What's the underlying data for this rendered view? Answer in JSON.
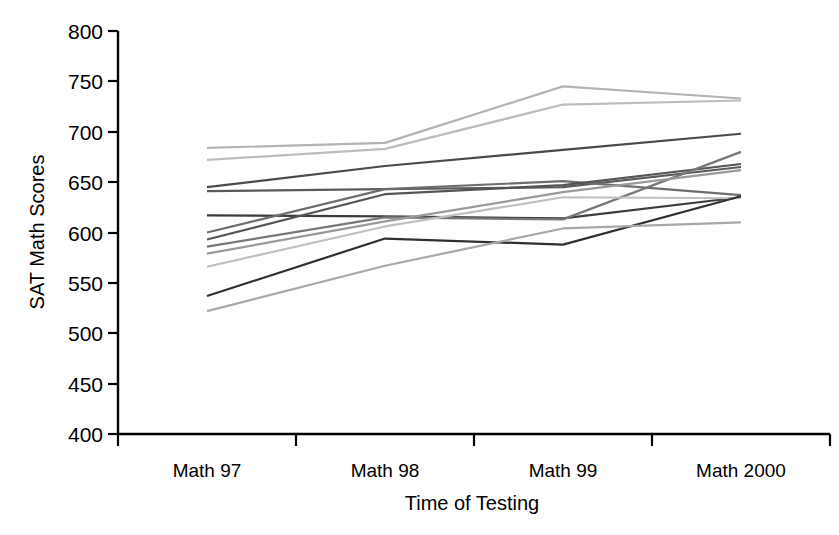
{
  "chart_data": {
    "type": "line",
    "title": "",
    "xlabel": "Time of Testing",
    "ylabel": "SAT Math Scores",
    "categories": [
      "Math 97",
      "Math 98",
      "Math 99",
      "Math 2000"
    ],
    "ylim": [
      400,
      800
    ],
    "yticks": [
      400,
      450,
      500,
      550,
      600,
      650,
      700,
      750,
      800
    ],
    "grid": false,
    "legend": false,
    "series": [
      {
        "name": "Series 1",
        "values": [
          684,
          689,
          745,
          733
        ],
        "color": "#b4b4b4"
      },
      {
        "name": "Series 2",
        "values": [
          672,
          683,
          727,
          731
        ],
        "color": "#bdbdbd"
      },
      {
        "name": "Series 3",
        "values": [
          645,
          666,
          682,
          698
        ],
        "color": "#4a4a4a"
      },
      {
        "name": "Series 4",
        "values": [
          641,
          643,
          645,
          665
        ],
        "color": "#5a5a5a"
      },
      {
        "name": "Series 5",
        "values": [
          617,
          616,
          614,
          635
        ],
        "color": "#3c3c3c"
      },
      {
        "name": "Series 6",
        "values": [
          600,
          643,
          651,
          637
        ],
        "color": "#6e6e6e"
      },
      {
        "name": "Series 7",
        "values": [
          593,
          638,
          647,
          668
        ],
        "color": "#555555"
      },
      {
        "name": "Series 8",
        "values": [
          586,
          615,
          613,
          680
        ],
        "color": "#787878"
      },
      {
        "name": "Series 9",
        "values": [
          579,
          611,
          640,
          662
        ],
        "color": "#9a9a9a"
      },
      {
        "name": "Series 10",
        "values": [
          566,
          606,
          635,
          634
        ],
        "color": "#c0c0c0"
      },
      {
        "name": "Series 11",
        "values": [
          537,
          594,
          588,
          636
        ],
        "color": "#303030"
      },
      {
        "name": "Series 12",
        "values": [
          522,
          567,
          604,
          610
        ],
        "color": "#a8a8a8"
      }
    ]
  },
  "axis": {
    "y_label": "SAT Math Scores",
    "x_label": "Time of Testing",
    "y_tick_labels": [
      "800",
      "750",
      "700",
      "650",
      "600",
      "550",
      "500",
      "450",
      "400"
    ],
    "x_tick_labels": [
      "Math 97",
      "Math 98",
      "Math 99",
      "Math 2000"
    ]
  },
  "colors": {
    "axis": "#000000",
    "background": "#ffffff"
  }
}
